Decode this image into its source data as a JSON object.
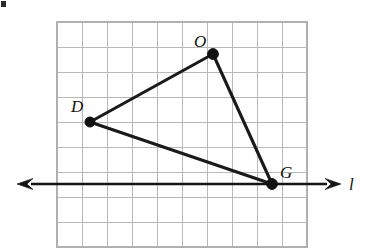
{
  "figure": {
    "type": "geometry-diagram",
    "canvas": {
      "width": 374,
      "height": 249,
      "background": "#ffffff"
    },
    "grid": {
      "origin_x": 57,
      "origin_y": 22,
      "cell_size": 25,
      "columns": 10,
      "rows": 9,
      "line_color": "#b9b9b9",
      "border_color": "#b0b0b0",
      "visible": true
    },
    "vertices": [
      {
        "name": "D",
        "label": "D",
        "x": 90,
        "y": 122,
        "grid_col": 1.32,
        "grid_row": 4,
        "label_x": 71,
        "label_y": 112,
        "dot_radius": 5
      },
      {
        "name": "O",
        "label": "O",
        "x": 213,
        "y": 54,
        "grid_col": 6.24,
        "grid_row": 1.28,
        "label_x": 194,
        "label_y": 47,
        "dot_radius": 5.4
      },
      {
        "name": "G",
        "label": "G",
        "x": 272,
        "y": 184,
        "grid_col": 8.6,
        "grid_row": 6.48,
        "label_x": 280,
        "label_y": 178,
        "dot_radius": 5.4
      }
    ],
    "sides": [
      {
        "name": "DO",
        "from": "D",
        "to": "O"
      },
      {
        "name": "OG",
        "from": "O",
        "to": "G"
      },
      {
        "name": "GD",
        "from": "G",
        "to": "D"
      }
    ],
    "line": {
      "name": "l",
      "label": "l",
      "y": 184,
      "x_start": 17,
      "x_end": 341,
      "label_x": 349,
      "label_y": 190,
      "color": "#141414",
      "arrow_left": true,
      "arrow_right": true
    },
    "colors": {
      "stroke": "#1a1a1a",
      "grid": "#b9b9b9",
      "background": "#ffffff",
      "vertex": "#111111"
    }
  },
  "chart_data": {
    "type": "scatter",
    "title": "",
    "xlabel": "",
    "ylabel": "",
    "grid": true,
    "legend": "none",
    "note": "Triangle DOG plotted on unit grid; line l is horizontal through G",
    "points": [
      {
        "label": "D",
        "x": 1.3,
        "y": 5.0
      },
      {
        "label": "O",
        "x": 6.2,
        "y": 7.7
      },
      {
        "label": "G",
        "x": 8.6,
        "y": 2.5
      }
    ],
    "series": [
      {
        "name": "triangle DOG",
        "x": [
          1.3,
          6.2,
          8.6,
          1.3
        ],
        "y": [
          5.0,
          7.7,
          2.5,
          5.0
        ]
      },
      {
        "name": "line l",
        "x": [
          -1.6,
          11.4
        ],
        "y": [
          2.5,
          2.5
        ]
      }
    ],
    "xlim": [
      0,
      10
    ],
    "ylim": [
      0,
      9
    ]
  }
}
